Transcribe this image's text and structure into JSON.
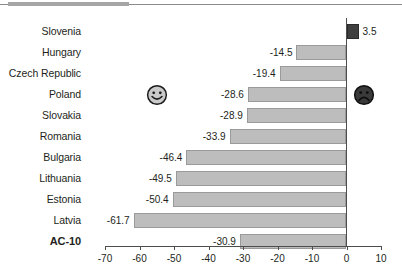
{
  "chart_data": {
    "type": "bar",
    "orientation": "horizontal",
    "title": "",
    "subtitle": "",
    "xlabel": "",
    "ylabel": "",
    "xlim": [
      -70,
      10
    ],
    "xticks": [
      -70,
      -60,
      -50,
      -40,
      -30,
      -20,
      -10,
      0,
      10
    ],
    "xtick_labels": [
      "-70",
      "-60",
      "-50",
      "-40",
      "-30",
      "-20",
      "-10",
      "0",
      "10"
    ],
    "grid": false,
    "legend": "none",
    "categories": [
      "Slovenia",
      "Hungary",
      "Czech Republic",
      "Poland",
      "Slovakia",
      "Romania",
      "Bulgaria",
      "Lithuania",
      "Estonia",
      "Latvia",
      "AC-10"
    ],
    "values": [
      3.5,
      -14.5,
      -19.4,
      -28.6,
      -28.9,
      -33.9,
      -46.4,
      -49.5,
      -50.4,
      -61.7,
      -30.9
    ],
    "value_labels": [
      "3.5",
      "-14.5",
      "-19.4",
      "-28.6",
      "-28.9",
      "-33.9",
      "-46.4",
      "-49.5",
      "-50.4",
      "-61.7",
      "-30.9"
    ],
    "bar_colors": [
      "#3f3f3f",
      "#bdbdbd",
      "#bdbdbd",
      "#bdbdbd",
      "#bdbdbd",
      "#bdbdbd",
      "#bdbdbd",
      "#bdbdbd",
      "#bdbdbd",
      "#bdbdbd",
      "#bdbdbd"
    ],
    "emphasis_category": "AC-10",
    "annotations": [
      {
        "name": "smiley-face",
        "glyph": "happy",
        "category": "Poland",
        "side": "left",
        "value_position": -55
      },
      {
        "name": "sad-face",
        "glyph": "sad",
        "category": "Poland",
        "side": "right",
        "value_position": 5
      }
    ]
  },
  "colors": {
    "bar_fill": "#bdbdbd",
    "bar_stroke": "#9a9a9a",
    "positive_fill": "#3f3f3f",
    "axis": "#4d4d4d",
    "text": "#231f20",
    "rule": "#8a8a8a",
    "rule_accent": "#a6a6a6"
  }
}
